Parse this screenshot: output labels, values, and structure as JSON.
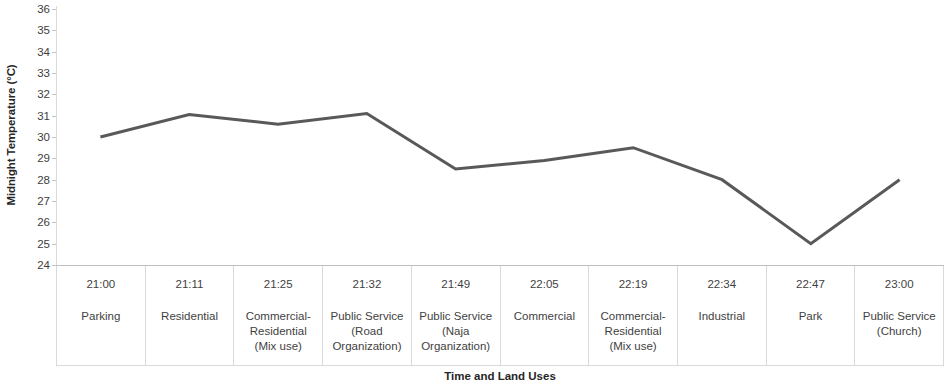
{
  "chart_data": {
    "type": "line",
    "title": "",
    "xlabel": "Time and Land Uses",
    "ylabel": "Midnight Temperature (°C)",
    "ylim": [
      24,
      36
    ],
    "ytick_labels": [
      "36",
      "35",
      "34",
      "33",
      "32",
      "31",
      "30",
      "29",
      "28",
      "27",
      "26",
      "25",
      "24"
    ],
    "ytick_values": [
      36,
      35,
      34,
      33,
      32,
      31,
      30,
      29,
      28,
      27,
      26,
      25,
      24
    ],
    "grid": false,
    "legend": "none",
    "line_color": "#595959",
    "line_width": 3,
    "categories": [
      "21:00",
      "21:11",
      "21:25",
      "21:32",
      "21:49",
      "22:05",
      "22:19",
      "22:34",
      "22:47",
      "23:00"
    ],
    "category_land_uses": [
      "Parking",
      "Residential",
      "Commercial-\nResidential\n(Mix use)",
      "Public Service\n(Road\nOrganization)",
      "Public Service\n(Naja\nOrganization)",
      "Commercial",
      "Commercial-\nResidential\n(Mix use)",
      "Industrial",
      "Park",
      "Public Service\n(Church)"
    ],
    "values": [
      30.0,
      31.05,
      30.6,
      31.1,
      28.5,
      28.9,
      29.5,
      28.0,
      25.0,
      28.0
    ]
  },
  "axis": {
    "x_title": "Time and Land Uses",
    "y_title": "Midnight Temperature (°C)"
  },
  "table": {
    "rows": [
      {
        "time": "21:00",
        "land_use": "Parking"
      },
      {
        "time": "21:11",
        "land_use": "Residential"
      },
      {
        "time": "21:25",
        "land_use": "Commercial-\nResidential\n(Mix use)"
      },
      {
        "time": "21:32",
        "land_use": "Public Service\n(Road\nOrganization)"
      },
      {
        "time": "21:49",
        "land_use": "Public Service\n(Naja\nOrganization)"
      },
      {
        "time": "22:05",
        "land_use": "Commercial"
      },
      {
        "time": "22:19",
        "land_use": "Commercial-\nResidential\n(Mix use)"
      },
      {
        "time": "22:34",
        "land_use": "Industrial"
      },
      {
        "time": "22:47",
        "land_use": "Park"
      },
      {
        "time": "23:00",
        "land_use": "Public Service\n(Church)"
      }
    ]
  }
}
